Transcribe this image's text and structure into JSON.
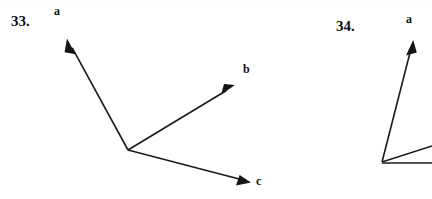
{
  "page": {
    "width": 432,
    "height": 199,
    "background_color": "#ffffff",
    "ink_color": "#141414"
  },
  "figures": [
    {
      "id": "figure-33",
      "number_label": "33.",
      "origin": {
        "x": 128,
        "y": 150
      },
      "vectors": [
        {
          "name": "a",
          "label": "a",
          "direction": "up-left",
          "tip": {
            "x": 68,
            "y": 40
          },
          "has_arrowhead": true
        },
        {
          "name": "b",
          "label": "b",
          "direction": "up-right",
          "tip": {
            "x": 234,
            "y": 86
          },
          "has_arrowhead": true
        },
        {
          "name": "c",
          "label": "c",
          "direction": "down-right",
          "tip": {
            "x": 250,
            "y": 182
          },
          "has_arrowhead": true
        }
      ]
    },
    {
      "id": "figure-34",
      "number_label": "34.",
      "origin": {
        "x": 382,
        "y": 162
      },
      "cropped_at_right_edge": true,
      "vectors": [
        {
          "name": "a",
          "label": "a",
          "direction": "up",
          "tip": {
            "x": 413,
            "y": 41
          },
          "has_arrowhead": true
        },
        {
          "name": "unlabeled-diagonal",
          "label": "",
          "direction": "up-right",
          "tip": {
            "x": 432,
            "y": 146
          },
          "has_arrowhead": false
        },
        {
          "name": "unlabeled-horizontal",
          "label": "",
          "direction": "right",
          "tip": {
            "x": 432,
            "y": 163
          },
          "has_arrowhead": false
        }
      ]
    }
  ]
}
